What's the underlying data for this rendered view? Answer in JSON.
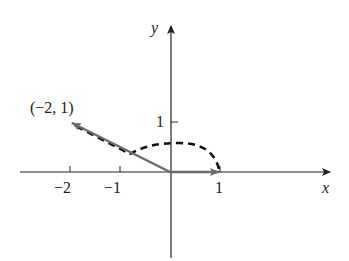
{
  "diagram": {
    "type": "vector-rotation",
    "axes": {
      "x_label": "x",
      "y_label": "y",
      "x_ticks": [
        "−2",
        "−1",
        "1"
      ],
      "y_ticks": [
        "1"
      ]
    },
    "point_label": "(−2, 1)",
    "vectors": [
      {
        "name": "unit-vector-e1",
        "from": [
          0,
          0
        ],
        "to": [
          1,
          0
        ],
        "color": "#6b6b6b"
      },
      {
        "name": "vector-minus2-1",
        "from": [
          0,
          0
        ],
        "to": [
          -2,
          1
        ],
        "color": "#6b6b6b"
      }
    ],
    "arc": {
      "style": "dashed",
      "from": [
        1,
        0
      ],
      "to_direction": [
        -2,
        1
      ],
      "color": "#111111"
    },
    "colors": {
      "axis": "#222222",
      "vector": "#6b6b6b",
      "arc": "#111111"
    }
  }
}
